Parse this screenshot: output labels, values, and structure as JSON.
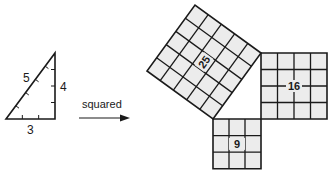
{
  "triangle": {
    "hypotenuse_label": "5",
    "vertical_label": "4",
    "base_label": "3"
  },
  "arrow": {
    "label": "squared"
  },
  "squares": [
    {
      "name": "square-on-hypotenuse",
      "side": 5,
      "area_label": "25"
    },
    {
      "name": "square-on-vertical-leg",
      "side": 4,
      "area_label": "16"
    },
    {
      "name": "square-on-base",
      "side": 3,
      "area_label": "9"
    }
  ],
  "colors": {
    "line": "#1a1a1a",
    "fill": "#ececec"
  }
}
